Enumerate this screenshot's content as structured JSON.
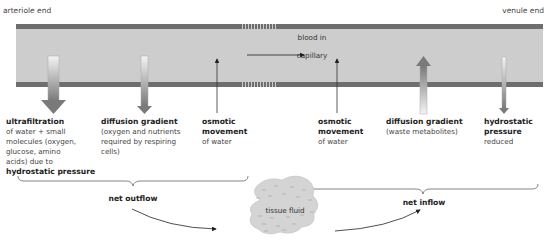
{
  "diagram": {
    "title_left": "arteriole end",
    "title_right": "venule end",
    "blood_flow": {
      "line1": "blood in",
      "line2": "capillary"
    },
    "arterial_side": [
      {
        "title": "ultrafiltration",
        "lines": [
          "of water + small",
          "molecules (oxygen,",
          "glucose, amino",
          "acids) due to"
        ],
        "bold_tail": "hydrostatic pressure",
        "arrow": "down-thick"
      },
      {
        "title": "diffusion gradient",
        "lines": [
          "(oxygen and nutrients",
          "required by respiring",
          "cells)"
        ],
        "arrow": "down-medium"
      },
      {
        "title": "osmotic",
        "title2": "movement",
        "lines": [
          "of water"
        ],
        "arrow": "up-thin"
      }
    ],
    "venous_side": [
      {
        "title": "osmotic",
        "title2": "movement",
        "lines": [
          "of water"
        ],
        "arrow": "up-thin"
      },
      {
        "title": "diffusion gradient",
        "lines": [
          "(waste metabolites)"
        ],
        "arrow": "up-thick"
      },
      {
        "title": "hydrostatic",
        "title2": "pressure",
        "lines": [
          "reduced"
        ],
        "arrow": "down-thin"
      }
    ],
    "net_outflow": "net outflow",
    "net_inflow": "net inflow",
    "tissue_fluid": "tissue fluid",
    "colors": {
      "wall": "#6e6e6e",
      "lumen": "#cdcdcd",
      "arrow_dark": "#7a7a7a",
      "text": "#2b2b2b"
    }
  }
}
